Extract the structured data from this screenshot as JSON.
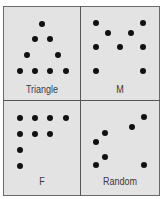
{
  "figure": {
    "background_color": "#e3e3e3",
    "dot_color": "#111111",
    "border_color": "#555555",
    "label_color": "#3a3a3a"
  },
  "panels": [
    {
      "label": "Triangle",
      "label_pos": [
        42,
        85
      ],
      "dots": [
        [
          42,
          24
        ],
        [
          35,
          39
        ],
        [
          50,
          39
        ],
        [
          27,
          55
        ],
        [
          58,
          55
        ],
        [
          20,
          71
        ],
        [
          35,
          71
        ],
        [
          50,
          71
        ],
        [
          66,
          71
        ]
      ]
    },
    {
      "label": "M",
      "label_pos": [
        120,
        85
      ],
      "dots": [
        [
          96,
          23
        ],
        [
          143,
          23
        ],
        [
          108,
          33
        ],
        [
          131,
          33
        ],
        [
          96,
          47
        ],
        [
          120,
          47
        ],
        [
          143,
          47
        ],
        [
          96,
          71
        ],
        [
          143,
          71
        ]
      ]
    },
    {
      "label": "F",
      "label_pos": [
        42,
        177
      ],
      "dots": [
        [
          20,
          118
        ],
        [
          35,
          118
        ],
        [
          50,
          118
        ],
        [
          66,
          118
        ],
        [
          20,
          134
        ],
        [
          35,
          134
        ],
        [
          50,
          134
        ],
        [
          20,
          150
        ],
        [
          20,
          166
        ]
      ]
    },
    {
      "label": "Random",
      "label_pos": [
        120,
        177
      ],
      "dots": [
        [
          144,
          117
        ],
        [
          132,
          127
        ],
        [
          105,
          133
        ],
        [
          96,
          142
        ],
        [
          105,
          157
        ],
        [
          96,
          165
        ],
        [
          144,
          165
        ]
      ]
    }
  ]
}
